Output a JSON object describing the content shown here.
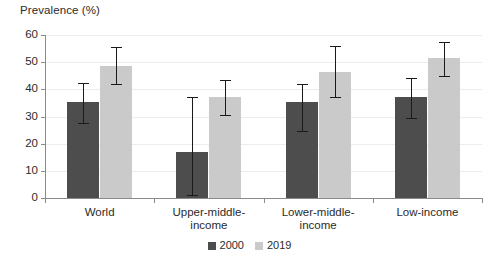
{
  "chart_data": {
    "type": "bar",
    "title": "",
    "xlabel": "",
    "ylabel": "Prevalence (%)",
    "ylim": [
      0,
      60
    ],
    "yticks": [
      0,
      10,
      20,
      30,
      40,
      50,
      60
    ],
    "ytick_labels": [
      "0",
      "10",
      "20",
      "30",
      "40",
      "50",
      "60"
    ],
    "grid": true,
    "legend_position": "bottom-center",
    "categories": [
      "World",
      "Upper-middle-income",
      "Lower-middle-income",
      "Low-income"
    ],
    "category_labels": [
      "World",
      "Upper-middle-\nincome",
      "Lower-middle-\nincome",
      "Low-income"
    ],
    "series": [
      {
        "name": "2000",
        "color": "#4d4d4d",
        "values": [
          35.5,
          17.0,
          35.5,
          37.0
        ],
        "err_low": [
          27.5,
          1.0,
          24.5,
          29.5
        ],
        "err_high": [
          42.5,
          37.0,
          42.0,
          44.0
        ]
      },
      {
        "name": "2019",
        "color": "#cacaca",
        "values": [
          48.5,
          37.0,
          46.5,
          51.5
        ],
        "err_low": [
          42.0,
          30.5,
          37.0,
          45.0
        ],
        "err_high": [
          55.5,
          43.5,
          56.0,
          57.5
        ]
      }
    ]
  },
  "axis": {
    "y_title": "Prevalence (%)"
  },
  "legend": {
    "items": [
      {
        "label": "2000",
        "color": "#4d4d4d"
      },
      {
        "label": "2019",
        "color": "#cacaca"
      }
    ]
  },
  "colors": {
    "series_2000": "#4d4d4d",
    "series_2019": "#cacaca",
    "gridline": "#ededed",
    "axis": "#8a8a8a",
    "error_bar": "#1a1a1a",
    "text": "#2b2b2b",
    "background": "#ffffff"
  }
}
